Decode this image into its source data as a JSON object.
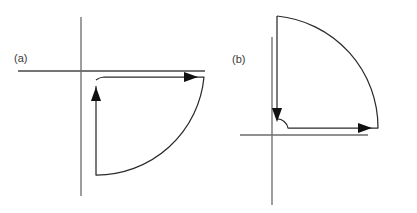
{
  "figure": {
    "background_color": "#ffffff",
    "axis_color": "#6b6b6b",
    "contour_color": "#2a2a2a",
    "arrow_color": "#101010",
    "label_color": "#3a3a3a",
    "width": 417,
    "height": 213
  },
  "panels": [
    {
      "id": "panel-a",
      "label": "(a)",
      "label_x": 14,
      "label_y": 62,
      "origin": {
        "x": 81,
        "y": 71
      },
      "axes": {
        "horizontal": {
          "x1": 18,
          "y1": 71,
          "x2": 205,
          "y2": 71
        },
        "vertical": {
          "x1": 81,
          "y1": 17,
          "x2": 81,
          "y2": 196
        }
      },
      "contour": {
        "description": "quarter-circle keyhole contour in the fourth quadrant traversed counter-clockwise",
        "small_radius": 15,
        "large_radius": 108,
        "inner_start": {
          "x": 96,
          "y": 80
        },
        "inner_end": {
          "x": 104,
          "y": 77
        },
        "outer_radius_end": {
          "x": 204,
          "y": 77
        },
        "arc_end": {
          "x": 96,
          "y": 175
        },
        "return_end": {
          "x": 96,
          "y": 86
        },
        "path": "M 96 80 A 15 15 0 0 1 104 77 L 204 77 A 108 108 0 0 1 96 175 L 96 86"
      },
      "arrows": [
        {
          "name": "arrow-right",
          "x": 198,
          "y": 77,
          "direction": "right"
        },
        {
          "name": "arrow-up",
          "x": 96,
          "y": 87,
          "direction": "up"
        }
      ]
    },
    {
      "id": "panel-b",
      "label": "(b)",
      "label_x": 232,
      "label_y": 63,
      "origin": {
        "x": 272,
        "y": 135
      },
      "axes": {
        "horizontal": {
          "x1": 240,
          "y1": 135,
          "x2": 368,
          "y2": 135
        },
        "vertical": {
          "x1": 272,
          "y1": 37,
          "x2": 272,
          "y2": 205
        }
      },
      "contour": {
        "description": "quarter-circle keyhole contour in the first quadrant traversed clockwise",
        "small_radius": 11,
        "large_radius": 112,
        "top_start": {
          "x": 277,
          "y": 16
        },
        "outer_radius_end": {
          "x": 378,
          "y": 128
        },
        "inner_start": {
          "x": 288,
          "y": 128
        },
        "inner_end": {
          "x": 277,
          "y": 121
        },
        "return_end": {
          "x": 277,
          "y": 114
        },
        "path": "M 277 16 A 112 112 0 0 1 378 128 L 288 128 A 11 11 0 0 0 277 119"
      },
      "arrows": [
        {
          "name": "arrow-right",
          "x": 372,
          "y": 128,
          "direction": "right"
        },
        {
          "name": "arrow-down",
          "x": 277,
          "y": 122,
          "direction": "down"
        }
      ]
    }
  ]
}
